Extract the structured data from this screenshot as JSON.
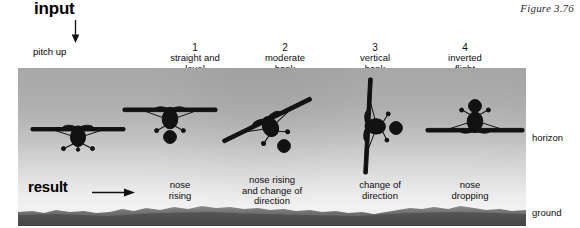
{
  "figure": {
    "caption": "Figure 3.76"
  },
  "input": {
    "label": "input",
    "arrow_icon": "arrow-down-icon",
    "sub_label": "pitch up"
  },
  "result": {
    "label": "result",
    "arrow_icon": "arrow-right-icon"
  },
  "side_labels": {
    "horizon": "horizon",
    "ground": "ground"
  },
  "columns": [
    {
      "number": "1",
      "title_line1": "straight and",
      "title_line2": "level",
      "result_line1": "nose",
      "result_line2": "rising",
      "result_line3": "",
      "aircraft": "aircraft-level"
    },
    {
      "number": "2",
      "title_line1": "moderate",
      "title_line2": "bank",
      "result_line1": "nose rising",
      "result_line2": "and change of",
      "result_line3": "direction",
      "aircraft": "aircraft-moderate-bank"
    },
    {
      "number": "3",
      "title_line1": "vertical",
      "title_line2": "bank",
      "result_line1": "change of",
      "result_line2": "direction",
      "result_line3": "",
      "aircraft": "aircraft-vertical-bank"
    },
    {
      "number": "4",
      "title_line1": "inverted",
      "title_line2": "flight",
      "result_line1": "nose",
      "result_line2": "dropping",
      "result_line3": "",
      "aircraft": "aircraft-inverted"
    }
  ],
  "colors": {
    "sky_top": "#a3a3a3",
    "sky_bottom": "#f2f2f2",
    "ground": "#6b6b6b",
    "aircraft": "#111111",
    "text": "#0e0e0e",
    "page": "#ffffff"
  }
}
